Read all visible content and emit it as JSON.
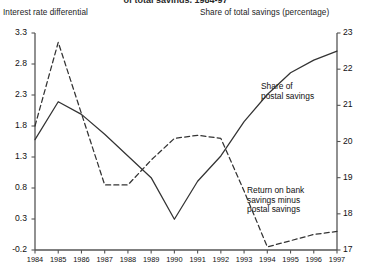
{
  "title_partial": "of total savings, 1984-97",
  "axis_left_caption": "Interest rate differential",
  "axis_right_caption": "Share of total savings (percentage)",
  "annotations": {
    "share": "Share of\npostal savings",
    "return": "Return on bank\nsavings minus\npostal savings"
  },
  "colors": {
    "line": "#333333",
    "axis": "#555555",
    "text": "#111111",
    "background": "#ffffff"
  },
  "chart_data": {
    "type": "line",
    "title": "of total savings, 1984-97",
    "xlabel": "",
    "grid": false,
    "legend": "annotations-inline",
    "x": [
      1984,
      1985,
      1986,
      1987,
      1988,
      1989,
      1990,
      1991,
      1992,
      1993,
      1994,
      1995,
      1996,
      1997
    ],
    "xtick_labels": [
      "1984",
      "1985",
      "1986",
      "1987",
      "1988",
      "1989",
      "1990",
      "1991",
      "1992",
      "1993",
      "1994",
      "1995",
      "1996",
      "1997"
    ],
    "axes": [
      {
        "id": "left",
        "label": "Interest rate differential",
        "ylim": [
          -0.2,
          3.3
        ],
        "yticks": [
          -0.2,
          0.3,
          0.8,
          1.3,
          1.8,
          2.3,
          2.8,
          3.3
        ],
        "ytick_labels": [
          "-0.2",
          "0.3",
          "0.8",
          "1.3",
          "1.8",
          "2.3",
          "2.8",
          "3.3"
        ]
      },
      {
        "id": "right",
        "label": "Share of total savings (percentage)",
        "ylim": [
          17,
          23
        ],
        "yticks": [
          17,
          18,
          19,
          20,
          21,
          22,
          23
        ],
        "ytick_labels": [
          "17",
          "18",
          "19",
          "20",
          "21",
          "22",
          "23"
        ]
      }
    ],
    "series": [
      {
        "name": "Share of postal savings",
        "axis": "right",
        "style": "solid",
        "values": [
          20.05,
          21.1,
          20.75,
          20.2,
          19.6,
          19.0,
          17.85,
          18.9,
          19.6,
          20.55,
          21.3,
          21.9,
          22.25,
          22.5
        ]
      },
      {
        "name": "Return on bank savings minus postal savings",
        "axis": "left",
        "style": "dashed",
        "values": [
          1.8,
          3.15,
          2.0,
          0.85,
          0.85,
          1.25,
          1.6,
          1.65,
          1.6,
          0.75,
          -0.15,
          -0.05,
          0.05,
          0.1
        ]
      }
    ]
  }
}
